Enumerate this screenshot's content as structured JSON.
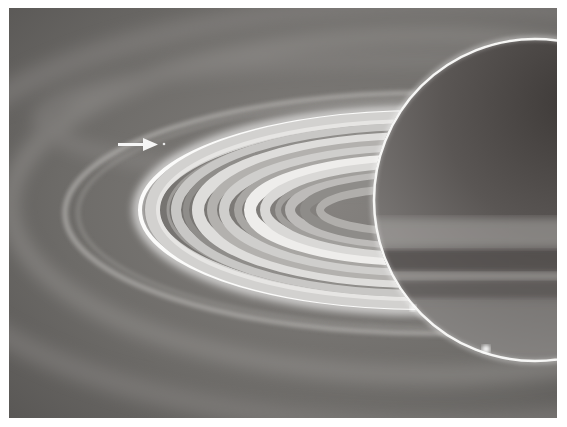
{
  "image": {
    "subject": "Saturn with rings, backlit",
    "palette": {
      "background": "#6e6c69",
      "planet_dark": "#4a4644",
      "planet_mid": "#777472",
      "ring_bright": "#f4f4f2",
      "limb": "#f8f8f8"
    }
  },
  "annotation": {
    "arrow": "right-arrow",
    "target": "small moon dot"
  }
}
